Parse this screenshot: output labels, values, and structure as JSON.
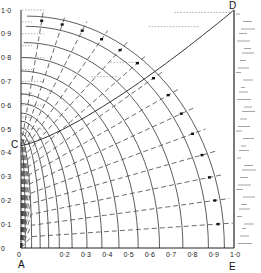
{
  "figure": {
    "title": "",
    "type": "flow-net diagram (orthogonal arcs and radial dashed lines in quarter-ellipse region)",
    "points": {
      "A": {
        "label": "A",
        "x": 0.0,
        "y": 0.0
      },
      "C": {
        "label": "C",
        "x": 0.0,
        "y": 0.43
      },
      "D": {
        "label": "D",
        "x": 1.0,
        "y": 1.0
      },
      "E": {
        "label": "E",
        "x": 1.0,
        "y": 0.0
      }
    },
    "y_axis": {
      "ticks": [
        "0",
        "0·1",
        "0·2",
        "0·3",
        "0·4",
        "0·5",
        "0·6",
        "0·7",
        "0·8",
        "0·9",
        "1·0"
      ],
      "range": [
        0,
        1.0
      ]
    },
    "x_axis": {
      "ticks": [
        "0",
        "0·2",
        "0·3",
        "0·4",
        "0·5",
        "0·6",
        "0·7",
        "0·8",
        "0·9",
        "1·0"
      ],
      "tick_values": [
        0,
        0.2,
        0.3,
        0.4,
        0.5,
        0.6,
        0.7,
        0.8,
        0.9,
        1.0
      ],
      "range": [
        0,
        1.0
      ]
    },
    "boundary": "outer curve C to D; right wall D to E shown hatched",
    "arc_count": 14,
    "radial_dashed_count": 14,
    "colors": {
      "line": "#333333",
      "dotted": "#777777",
      "background": "#ffffff"
    }
  }
}
